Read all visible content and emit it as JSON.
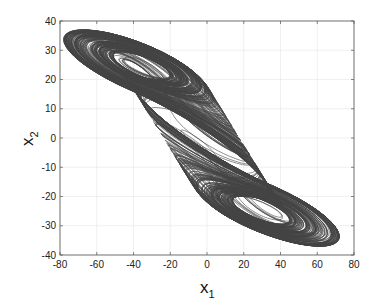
{
  "chart_data": {
    "type": "line",
    "title": "",
    "xlabel": "x1",
    "ylabel": "x2",
    "xlabel_main": "x",
    "xlabel_sub": "1",
    "ylabel_main": "x",
    "ylabel_sub": "2",
    "xlim": [
      -80,
      80
    ],
    "ylim": [
      -40,
      40
    ],
    "xticks": [
      -80,
      -60,
      -40,
      -20,
      0,
      20,
      40,
      60,
      80
    ],
    "yticks": [
      -40,
      -30,
      -20,
      -10,
      0,
      10,
      20,
      30,
      40
    ],
    "grid": true,
    "legend": null,
    "series": [
      {
        "name": "trajectory",
        "color": "#444444",
        "extent": {
          "x1": [
            -78,
            72
          ],
          "x2": [
            -37,
            37
          ]
        },
        "foci": [
          [
            0,
            12
          ],
          [
            0,
            -12
          ]
        ]
      }
    ]
  }
}
